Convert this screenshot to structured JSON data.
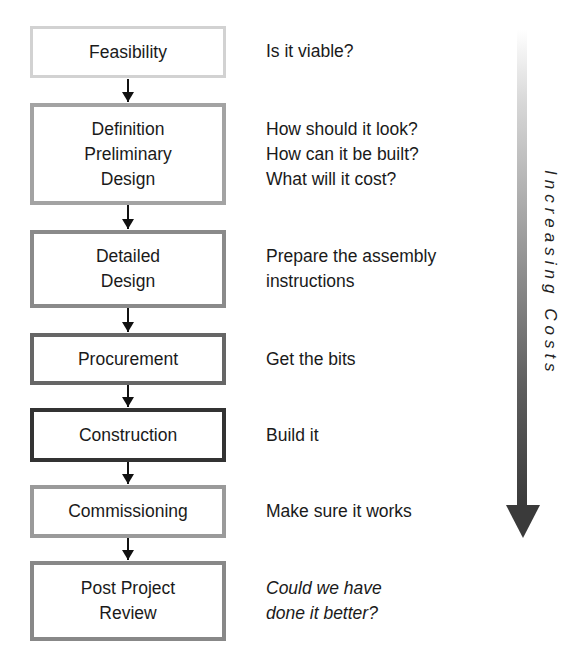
{
  "stages": [
    {
      "id": "feasibility",
      "lines": [
        "Feasibility"
      ],
      "border_color": "#d2d2d2",
      "border_width": 3,
      "description": [
        "Is it viable?"
      ],
      "description_italic": false
    },
    {
      "id": "definition-preliminary-design",
      "lines": [
        "Definition",
        "Preliminary",
        "Design"
      ],
      "border_color": "#a3a3a3",
      "border_width": 4,
      "description": [
        "How should it look?",
        "How can it be built?",
        "What will it cost?"
      ],
      "description_italic": false
    },
    {
      "id": "detailed-design",
      "lines": [
        "Detailed",
        "Design"
      ],
      "border_color": "#8a8a8a",
      "border_width": 4,
      "description": [
        "Prepare the assembly",
        "instructions"
      ],
      "description_italic": false
    },
    {
      "id": "procurement",
      "lines": [
        "Procurement"
      ],
      "border_color": "#666666",
      "border_width": 4,
      "description": [
        "Get the bits"
      ],
      "description_italic": false
    },
    {
      "id": "construction",
      "lines": [
        "Construction"
      ],
      "border_color": "#333333",
      "border_width": 4,
      "description": [
        "Build it"
      ],
      "description_italic": false
    },
    {
      "id": "commissioning",
      "lines": [
        "Commissioning"
      ],
      "border_color": "#9a9a9a",
      "border_width": 4,
      "description": [
        "Make sure it works"
      ],
      "description_italic": false
    },
    {
      "id": "post-project-review",
      "lines": [
        "Post Project",
        "Review"
      ],
      "border_color": "#888888",
      "border_width": 4,
      "description": [
        "Could we have",
        "done it better?"
      ],
      "description_italic": true
    }
  ],
  "cost_arrow": {
    "label": "Increasing Costs",
    "color_start": "#ffffff",
    "color_end": "#3a3a3a"
  }
}
